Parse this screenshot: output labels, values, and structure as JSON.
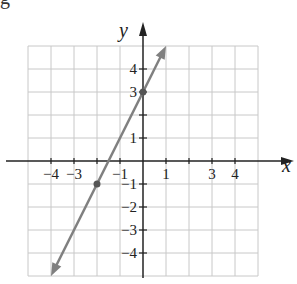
{
  "fragment_label": "g",
  "chart_data": {
    "type": "line",
    "title": "",
    "xlabel": "x",
    "ylabel": "y",
    "xlim": [
      -5,
      5
    ],
    "ylim": [
      -5,
      5
    ],
    "grid": true,
    "x_tick_labels": [
      "-4",
      "-3",
      "-1",
      "1",
      "3",
      "4"
    ],
    "x_tick_values": [
      -4,
      -3,
      -1,
      1,
      3,
      4
    ],
    "y_tick_labels": [
      "4",
      "3",
      "1",
      "-1",
      "-2",
      "-3",
      "-4"
    ],
    "y_tick_values": [
      4,
      3,
      1,
      -1,
      -2,
      -3,
      -4
    ],
    "series": [
      {
        "name": "y = 2x + 3",
        "equation": "y = 2x + 3",
        "x": [
          -4,
          1
        ],
        "y": [
          -5,
          5
        ],
        "arrows": "both",
        "color": "#808080"
      }
    ],
    "points": [
      {
        "x": 0,
        "y": 3
      },
      {
        "x": -2,
        "y": -1
      }
    ]
  },
  "colors": {
    "grid": "#c8c8c8",
    "axis": "#222222",
    "line": "#808080",
    "text": "#222222"
  }
}
